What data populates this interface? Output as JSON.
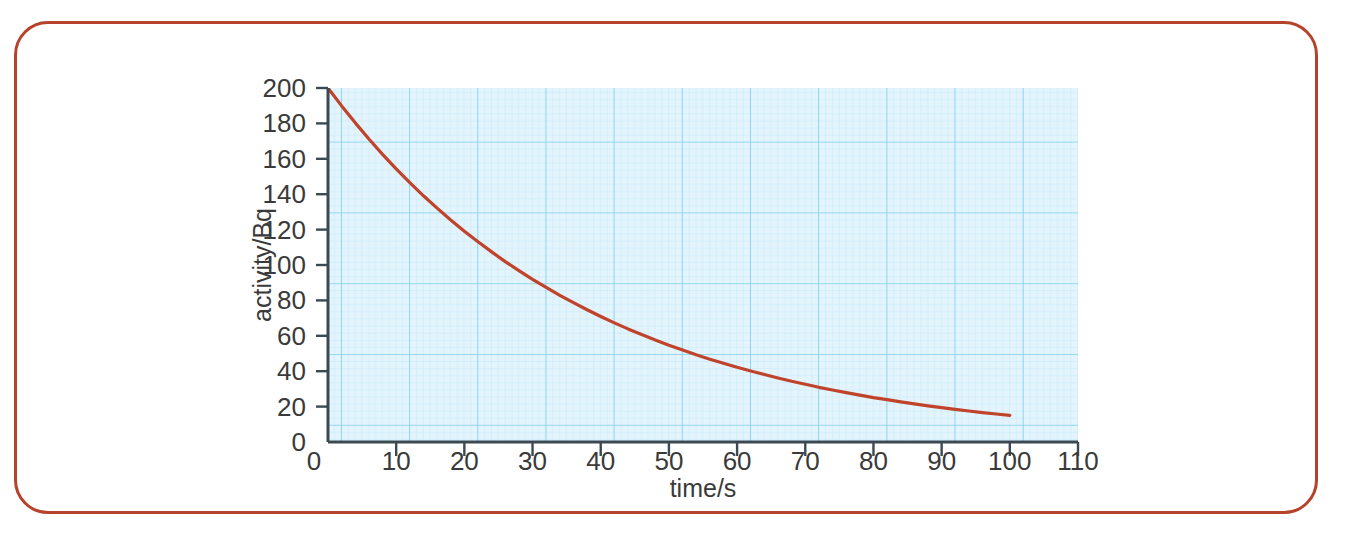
{
  "page": {
    "background": "#ffffff",
    "frame_color": "#b5432b"
  },
  "chart_data": {
    "type": "line",
    "title": "",
    "subtitle": "",
    "xlabel": "time/s",
    "ylabel": "activity/Bq",
    "xlim": [
      0,
      110
    ],
    "ylim": [
      0,
      200
    ],
    "xticks": [
      0,
      10,
      20,
      30,
      40,
      50,
      60,
      70,
      80,
      90,
      100,
      110
    ],
    "yticks": [
      0,
      20,
      40,
      60,
      80,
      100,
      120,
      140,
      160,
      180,
      200
    ],
    "xtick_labels": [
      "0",
      "10",
      "20",
      "30",
      "40",
      "50",
      "60",
      "70",
      "80",
      "90",
      "100",
      "110"
    ],
    "ytick_labels": [
      "0",
      "20",
      "40",
      "60",
      "80",
      "100",
      "120",
      "140",
      "160",
      "180",
      "200"
    ],
    "grid": true,
    "grid_style": "graph-paper",
    "grid_color": "#8fd8f2",
    "grid_minor_color": "#cdeefa",
    "plot_background": "#ddf2fb",
    "legend": false,
    "legend_position": "none",
    "axis_color": "#3a4a52",
    "series": [
      {
        "name": "activity",
        "color": "#c0432b",
        "line_width": 3,
        "x": [
          0,
          2,
          4,
          6,
          8,
          10,
          12,
          14,
          16,
          18,
          20,
          22,
          24,
          26,
          28,
          30,
          32,
          34,
          36,
          38,
          40,
          42,
          44,
          46,
          48,
          50,
          52,
          54,
          56,
          58,
          60,
          62,
          64,
          66,
          68,
          70,
          72,
          74,
          76,
          78,
          80,
          82,
          84,
          86,
          88,
          90,
          92,
          94,
          96,
          98,
          100
        ],
        "values": [
          200.0,
          189.9,
          180.3,
          171.2,
          162.5,
          154.3,
          146.5,
          139.1,
          132.1,
          125.4,
          119.1,
          113.1,
          107.4,
          101.9,
          96.8,
          91.9,
          87.3,
          82.9,
          78.7,
          74.7,
          70.9,
          67.3,
          63.9,
          60.7,
          57.6,
          54.7,
          52.0,
          49.3,
          46.8,
          44.5,
          42.2,
          40.1,
          38.1,
          36.2,
          34.3,
          32.6,
          30.9,
          29.4,
          27.9,
          26.5,
          25.1,
          23.9,
          22.7,
          21.5,
          20.4,
          19.4,
          18.4,
          17.5,
          16.6,
          15.8,
          15.0
        ]
      }
    ],
    "annotations": []
  }
}
